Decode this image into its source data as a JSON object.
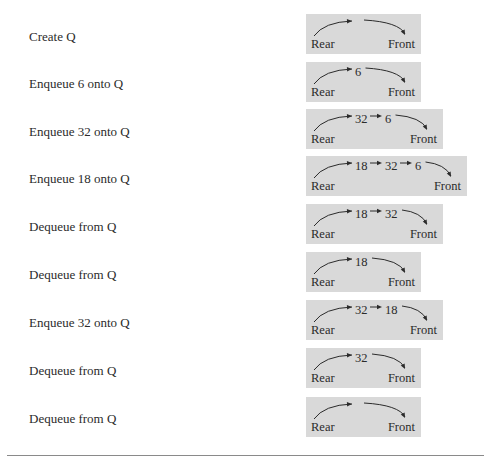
{
  "rows": [
    {
      "operation": "Create Q",
      "queue": [],
      "rear_label": "Rear",
      "front_label": "Front"
    },
    {
      "operation": "Enqueue 6 onto Q",
      "queue": [
        "6"
      ],
      "rear_label": "Rear",
      "front_label": "Front"
    },
    {
      "operation": "Enqueue 32 onto Q",
      "queue": [
        "32",
        "6"
      ],
      "rear_label": "Rear",
      "front_label": "Front"
    },
    {
      "operation": "Enqueue 18 onto Q",
      "queue": [
        "18",
        "32",
        "6"
      ],
      "rear_label": "Rear",
      "front_label": "Front"
    },
    {
      "operation": "Dequeue from Q",
      "queue": [
        "18",
        "32"
      ],
      "rear_label": "Rear",
      "front_label": "Front"
    },
    {
      "operation": "Dequeue from Q",
      "queue": [
        "18"
      ],
      "rear_label": "Rear",
      "front_label": "Front"
    },
    {
      "operation": "Enqueue 32 onto Q",
      "queue": [
        "32",
        "18"
      ],
      "rear_label": "Rear",
      "front_label": "Front"
    },
    {
      "operation": "Dequeue from Q",
      "queue": [
        "32"
      ],
      "rear_label": "Rear",
      "front_label": "Front"
    },
    {
      "operation": "Dequeue from Q",
      "queue": [],
      "rear_label": "Rear",
      "front_label": "Front"
    }
  ],
  "colors": {
    "box_background": "#d9d9d9",
    "ink": "#2b2b2b",
    "rule": "#8a8a8a"
  }
}
